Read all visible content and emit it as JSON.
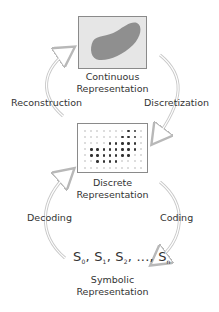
{
  "nodes": {
    "continuous": {
      "label_line1": "Continuous",
      "label_line2": "Representation"
    },
    "discrete": {
      "label_line1": "Discrete",
      "label_line2": "Representation"
    },
    "symbolic": {
      "label_line1": "Symbolic",
      "label_line2": "Representation",
      "symbols": {
        "s0": "S",
        "s0_sub": "0",
        "s1": "S",
        "s1_sub": "1",
        "s2": "S",
        "s2_sub": "2",
        "ellipsis": "...,",
        "sn": "S",
        "sn_sub": "n"
      }
    }
  },
  "edges": {
    "reconstruction": "Reconstruction",
    "discretization": "Discretization",
    "decoding": "Decoding",
    "coding": "Coding"
  },
  "discrete_grid": {
    "cols": 10,
    "rows": 7,
    "matrix": [
      [
        0,
        0,
        0,
        0,
        0,
        0,
        0,
        1,
        1,
        0
      ],
      [
        0,
        0,
        0,
        0,
        0,
        0,
        1,
        1,
        1,
        0
      ],
      [
        0,
        0,
        0,
        0,
        1,
        1,
        1,
        1,
        1,
        0
      ],
      [
        0,
        1,
        1,
        1,
        1,
        1,
        1,
        1,
        1,
        0
      ],
      [
        0,
        1,
        1,
        1,
        1,
        1,
        1,
        1,
        0,
        0
      ],
      [
        0,
        0,
        1,
        1,
        1,
        1,
        0,
        0,
        0,
        0
      ],
      [
        0,
        0,
        0,
        0,
        0,
        0,
        0,
        0,
        0,
        0
      ]
    ]
  },
  "colors": {
    "box_fill": "#e6e6e6",
    "blob": "#8f8f8f",
    "arrow": "#c8c8c8",
    "text": "#333333"
  }
}
